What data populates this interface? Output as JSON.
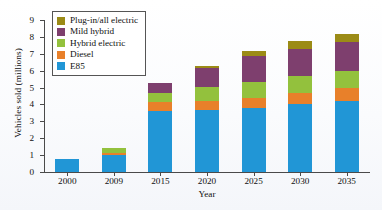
{
  "chart_data": {
    "type": "bar",
    "stacked": true,
    "title": "",
    "xlabel": "Year",
    "ylabel": "Vehicles sold (millions)",
    "categories": [
      "2000",
      "2009",
      "2015",
      "2020",
      "2025",
      "2030",
      "2035"
    ],
    "ylim": [
      0,
      9
    ],
    "yticks": [
      0,
      1,
      2,
      3,
      4,
      5,
      6,
      7,
      8,
      9
    ],
    "ytick_labels": [
      "0",
      "1",
      "2",
      "3",
      "4",
      "5",
      "6",
      "7",
      "8",
      "9"
    ],
    "grid": false,
    "legend_position": "upper-left-inside",
    "series": [
      {
        "name": "E85",
        "color": "#2196d6",
        "values": [
          0.8,
          1.0,
          3.6,
          3.7,
          3.8,
          4.0,
          4.2
        ]
      },
      {
        "name": "Diesel",
        "color": "#e8802a",
        "values": [
          0.0,
          0.15,
          0.55,
          0.5,
          0.6,
          0.7,
          0.8
        ]
      },
      {
        "name": "Hybrid electric",
        "color": "#93c13d",
        "values": [
          0.0,
          0.25,
          0.55,
          0.85,
          0.95,
          1.0,
          1.0
        ]
      },
      {
        "name": "Mild hybrid",
        "color": "#7e3f6e",
        "values": [
          0.0,
          0.0,
          0.55,
          1.1,
          1.5,
          1.6,
          1.7
        ]
      },
      {
        "name": "Plug-in/all electric",
        "color": "#9b8b16",
        "values": [
          0.0,
          0.0,
          0.0,
          0.15,
          0.3,
          0.45,
          0.5
        ]
      }
    ],
    "totals": [
      0.8,
      1.4,
      5.25,
      6.3,
      7.15,
      7.75,
      8.2
    ]
  },
  "legend": {
    "items": [
      {
        "label": "Plug-in/all electric",
        "color": "#9b8b16"
      },
      {
        "label": "Mild hybrid",
        "color": "#7e3f6e"
      },
      {
        "label": "Hybrid electric",
        "color": "#93c13d"
      },
      {
        "label": "Diesel",
        "color": "#e8802a"
      },
      {
        "label": "E85",
        "color": "#2196d6"
      }
    ]
  }
}
